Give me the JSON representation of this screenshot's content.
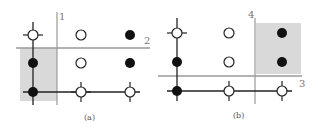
{
  "figure": {
    "panels": [
      {
        "id": "a",
        "caption": "(a)",
        "line_labels": {
          "vertical": "1",
          "horizontal": "2"
        },
        "grid": {
          "columns_x": [
            33,
            81,
            130
          ],
          "rows_y": [
            35,
            63,
            92
          ]
        },
        "points": [
          {
            "col": 0,
            "row": 0,
            "fill": "white",
            "crosshair": true
          },
          {
            "col": 1,
            "row": 0,
            "fill": "white",
            "crosshair": false
          },
          {
            "col": 2,
            "row": 0,
            "fill": "black",
            "crosshair": false
          },
          {
            "col": 0,
            "row": 1,
            "fill": "black",
            "crosshair": false
          },
          {
            "col": 1,
            "row": 1,
            "fill": "white",
            "crosshair": false
          },
          {
            "col": 2,
            "row": 1,
            "fill": "black",
            "crosshair": false
          },
          {
            "col": 0,
            "row": 2,
            "fill": "black",
            "crosshair": true
          },
          {
            "col": 1,
            "row": 2,
            "fill": "white",
            "crosshair": true
          },
          {
            "col": 2,
            "row": 2,
            "fill": "white",
            "crosshair": true
          }
        ],
        "shaded_region": "bottom-left"
      },
      {
        "id": "b",
        "caption": "(b)",
        "line_labels": {
          "vertical": "4",
          "horizontal": "3"
        },
        "grid": {
          "columns_x": [
            177,
            229,
            282
          ],
          "rows_y": [
            33,
            62,
            91
          ]
        },
        "points": [
          {
            "col": 0,
            "row": 0,
            "fill": "white",
            "crosshair": true
          },
          {
            "col": 1,
            "row": 0,
            "fill": "white",
            "crosshair": false
          },
          {
            "col": 2,
            "row": 0,
            "fill": "black",
            "crosshair": false
          },
          {
            "col": 0,
            "row": 1,
            "fill": "black",
            "crosshair": false
          },
          {
            "col": 1,
            "row": 1,
            "fill": "white",
            "crosshair": false
          },
          {
            "col": 2,
            "row": 1,
            "fill": "black",
            "crosshair": false
          },
          {
            "col": 0,
            "row": 2,
            "fill": "black",
            "crosshair": true
          },
          {
            "col": 1,
            "row": 2,
            "fill": "white",
            "crosshair": true
          },
          {
            "col": 2,
            "row": 2,
            "fill": "white",
            "crosshair": true
          }
        ],
        "shaded_region": "top-right"
      }
    ],
    "colors": {
      "shade": "#d9d9d9",
      "split_line": "#999999",
      "path_line": "#222222",
      "point_black": "#111111",
      "point_white": "#ffffff"
    }
  }
}
